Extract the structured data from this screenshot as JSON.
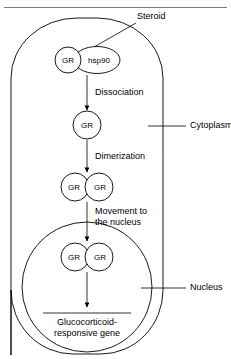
{
  "figure": {
    "top_rule": true,
    "background_color": "#ffffff",
    "line_color": "#000000",
    "rule_color": "#7a7a7a"
  },
  "labels": {
    "steroid": "Steroid",
    "cytoplasm": "Cytoplasm",
    "nucleus": "Nucleus"
  },
  "steps": [
    {
      "id": "dissociation",
      "label": "Dissociation"
    },
    {
      "id": "dimerization",
      "label": "Dimerization"
    },
    {
      "id": "movement-line1",
      "label": "Movement to"
    },
    {
      "id": "movement-line2",
      "label": "the nucleus"
    }
  ],
  "nodes": {
    "gr": "GR",
    "hsp90": "hsp90"
  },
  "complexes": [
    {
      "id": "gr-hsp90-complex",
      "members": [
        "GR",
        "hsp90"
      ]
    },
    {
      "id": "gr-free",
      "members": [
        "GR"
      ]
    },
    {
      "id": "gr-dimer-cytoplasm",
      "members": [
        "GR",
        "GR"
      ]
    },
    {
      "id": "gr-dimer-nucleus",
      "members": [
        "GR",
        "GR"
      ]
    }
  ],
  "gene": {
    "line1": "Glucocorticoid-",
    "line2": "responsive gene"
  },
  "compartments": [
    {
      "id": "cell",
      "name": "Cell"
    },
    {
      "id": "nucleus",
      "name": "Nucleus"
    }
  ]
}
